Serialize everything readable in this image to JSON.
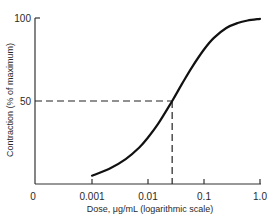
{
  "chart_data": {
    "type": "line",
    "title": "",
    "xlabel": "Dose, μg/mL (logarithmic scale)",
    "ylabel": "Contraction (% of maximum)",
    "xscale": "log",
    "x_ticks": [
      "0.001",
      "0.01",
      "0.1",
      "1.0"
    ],
    "x_origin_label": "0",
    "y_ticks": [
      "50",
      "100"
    ],
    "ylim": [
      0,
      100
    ],
    "xlim": [
      0.001,
      1.0
    ],
    "grid": false,
    "legend": null,
    "series": [
      {
        "name": "dose-response",
        "x": [
          0.001,
          0.002,
          0.004,
          0.007,
          0.01,
          0.015,
          0.027,
          0.04,
          0.06,
          0.1,
          0.15,
          0.25,
          0.4,
          0.6,
          1.0
        ],
        "y": [
          5,
          9,
          15,
          22,
          28,
          36,
          50,
          60,
          70,
          81,
          88,
          94,
          97,
          98.5,
          99.5
        ]
      }
    ],
    "annotations": [
      {
        "type": "dashed-guide",
        "x": 0.027,
        "y": 50,
        "note": "EC50 ~0.027 μg/mL at 50% contraction"
      }
    ]
  },
  "colors": {
    "axis": "#333333",
    "curve": "#111111",
    "text": "#2a2a2a"
  }
}
